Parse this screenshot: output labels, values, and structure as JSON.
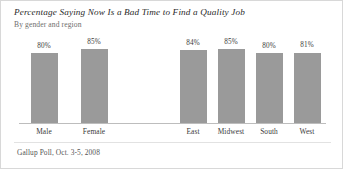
{
  "chart_data": {
    "type": "bar",
    "title": "Percentage Saying Now Is a Bad Time to Find a Quality Job",
    "subtitle": "By gender and region",
    "source": "Gallup Poll, Oct. 3-5, 2008",
    "categories": [
      "Male",
      "Female",
      "East",
      "Midwest",
      "South",
      "West"
    ],
    "values": [
      80,
      85,
      84,
      85,
      80,
      81
    ],
    "value_labels": [
      "80%",
      "85%",
      "84%",
      "85%",
      "80%",
      "81%"
    ],
    "groups": [
      {
        "name": "gender",
        "categories": [
          "Male",
          "Female"
        ],
        "values": [
          80,
          85
        ],
        "value_labels": [
          "80%",
          "85%"
        ]
      },
      {
        "name": "region",
        "categories": [
          "East",
          "Midwest",
          "South",
          "West"
        ],
        "values": [
          84,
          85,
          80,
          81
        ],
        "value_labels": [
          "84%",
          "85%",
          "80%",
          "81%"
        ]
      }
    ],
    "xlabel": "",
    "ylabel": "",
    "ylim": [
      0,
      100
    ],
    "grid": false,
    "legend": false,
    "bar_color": "#9a9a9a",
    "axis_color": "#bdbdbd"
  }
}
